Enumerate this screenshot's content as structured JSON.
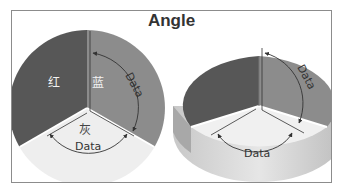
{
  "title": "Angle",
  "colors": {
    "dark_slice": "#575757",
    "mid_slice": "#8c8c8c",
    "light_slice": "#eeeeee",
    "frame": "#8c8c8c",
    "annotation": "#333333"
  },
  "left_pie": {
    "style": "2d",
    "slices": [
      {
        "label": "红",
        "color_name": "dark"
      },
      {
        "label": "蓝",
        "color_name": "mid"
      },
      {
        "label": "灰",
        "color_name": "light"
      }
    ],
    "annotations": [
      {
        "text": "Data",
        "position": "right-arc"
      },
      {
        "text": "Data",
        "position": "bottom-arc"
      }
    ]
  },
  "right_pie": {
    "style": "3d",
    "annotations": [
      {
        "text": "Data",
        "position": "right-arc"
      },
      {
        "text": "Data",
        "position": "bottom-arc"
      }
    ]
  }
}
